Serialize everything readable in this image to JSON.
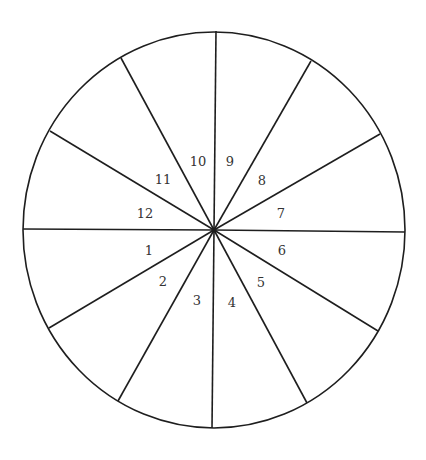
{
  "diagram": {
    "type": "divided-circle",
    "stroke_color": "#1e1e1e",
    "label_color": "#333333",
    "background": "#ffffff",
    "circle": {
      "cx": 214,
      "cy": 230,
      "rx": 191,
      "ry": 198
    },
    "center": {
      "x": 214,
      "y": 230
    },
    "spokes": [
      {
        "id": "spoke-left",
        "x": 23,
        "y": 229
      },
      {
        "id": "spoke-right",
        "x": 405,
        "y": 232
      },
      {
        "id": "spoke-top",
        "x": 216,
        "y": 31
      },
      {
        "id": "spoke-bottom",
        "x": 212,
        "y": 428
      },
      {
        "id": "spoke-upper-left-1",
        "x": 121,
        "y": 58
      },
      {
        "id": "spoke-upper-left-2",
        "x": 50,
        "y": 131
      },
      {
        "id": "spoke-upper-right-1",
        "x": 311,
        "y": 61
      },
      {
        "id": "spoke-upper-right-2",
        "x": 380,
        "y": 134
      },
      {
        "id": "spoke-lower-left-1",
        "x": 49,
        "y": 328
      },
      {
        "id": "spoke-lower-left-2",
        "x": 118,
        "y": 401
      },
      {
        "id": "spoke-lower-right-1",
        "x": 307,
        "y": 403
      },
      {
        "id": "spoke-lower-right-2",
        "x": 378,
        "y": 331
      }
    ],
    "sectors": [
      {
        "label": "1",
        "x": 149,
        "y": 250
      },
      {
        "label": "2",
        "x": 163,
        "y": 281
      },
      {
        "label": "3",
        "x": 197,
        "y": 300
      },
      {
        "label": "4",
        "x": 232,
        "y": 302
      },
      {
        "label": "5",
        "x": 261,
        "y": 282
      },
      {
        "label": "6",
        "x": 282,
        "y": 250
      },
      {
        "label": "7",
        "x": 281,
        "y": 213
      },
      {
        "label": "8",
        "x": 262,
        "y": 180
      },
      {
        "label": "9",
        "x": 230,
        "y": 161
      },
      {
        "label": "10",
        "x": 198,
        "y": 161
      },
      {
        "label": "11",
        "x": 163,
        "y": 179
      },
      {
        "label": "12",
        "x": 145,
        "y": 213
      }
    ]
  }
}
